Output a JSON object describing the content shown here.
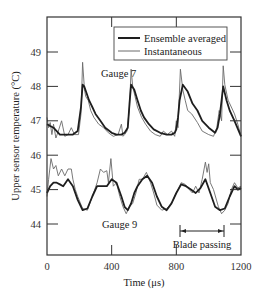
{
  "chart_data": {
    "type": "line",
    "title": "",
    "xlabel": "Time (μs)",
    "ylabel": "Upper sensor temperature (°C)",
    "xlim": [
      0,
      1200
    ],
    "ylim": [
      43.1,
      50.0
    ],
    "xticks": [
      0,
      400,
      800,
      1200
    ],
    "xtick_labels": [
      "0",
      "400",
      "800",
      "1200"
    ],
    "yticks": [
      44,
      45,
      46,
      47,
      48,
      49
    ],
    "ytick_labels": [
      "44",
      "45",
      "46",
      "47",
      "48",
      "49"
    ],
    "grid": false,
    "legend": {
      "position": "upper right",
      "entries": [
        {
          "label": "Ensemble averaged",
          "style": "thick"
        },
        {
          "label": "Instantaneous",
          "style": "thin"
        }
      ]
    },
    "annotations": [
      {
        "text": "Gauge 7",
        "x": 270,
        "y": 48.55
      },
      {
        "text": "Gauge 9",
        "x": 510,
        "y": 43.85
      },
      {
        "text": "Blade passing",
        "x_start": 820,
        "x_end": 1100,
        "y": 44.0,
        "type": "double-arrow"
      }
    ],
    "series": [
      {
        "name": "Gauge 7 - Ensemble averaged",
        "x": [
          0,
          20,
          40,
          60,
          80,
          100,
          130,
          160,
          190,
          210,
          220,
          230,
          245,
          260,
          280,
          300,
          330,
          360,
          400,
          430,
          460,
          480,
          500,
          510,
          520,
          540,
          560,
          580,
          600,
          630,
          660,
          700,
          740,
          770,
          790,
          800,
          810,
          820,
          840,
          870,
          900,
          930,
          960,
          1000,
          1040,
          1055,
          1070,
          1090,
          1110,
          1130,
          1160,
          1200
        ],
        "y": [
          46.9,
          46.85,
          46.8,
          46.7,
          46.6,
          46.6,
          46.6,
          46.6,
          46.7,
          47.4,
          48.05,
          48.0,
          47.8,
          47.6,
          47.4,
          47.2,
          47.0,
          46.8,
          46.65,
          46.6,
          46.6,
          46.65,
          46.8,
          47.5,
          48.05,
          47.9,
          47.6,
          47.3,
          47.1,
          46.9,
          46.75,
          46.65,
          46.6,
          46.6,
          46.65,
          46.75,
          47.1,
          47.6,
          48.05,
          47.85,
          47.5,
          47.3,
          47.0,
          46.8,
          46.65,
          46.8,
          47.2,
          48.0,
          47.6,
          47.3,
          47.0,
          46.55
        ]
      },
      {
        "name": "Gauge 7 - Instantaneous",
        "x": [
          0,
          10,
          20,
          30,
          40,
          55,
          70,
          90,
          110,
          130,
          150,
          170,
          195,
          210,
          220,
          232,
          240,
          255,
          270,
          290,
          320,
          350,
          380,
          410,
          440,
          460,
          470,
          480,
          495,
          510,
          520,
          530,
          545,
          560,
          585,
          610,
          640,
          670,
          700,
          720,
          745,
          770,
          790,
          800,
          810,
          825,
          840,
          855,
          870,
          895,
          930,
          960,
          1000,
          1030,
          1050,
          1065,
          1080,
          1090,
          1100,
          1120,
          1140,
          1160,
          1180,
          1200
        ],
        "y": [
          47.1,
          46.8,
          46.95,
          46.6,
          46.9,
          46.5,
          46.7,
          47.0,
          46.55,
          46.6,
          46.8,
          46.6,
          46.6,
          47.2,
          48.7,
          47.9,
          47.7,
          47.6,
          47.3,
          47.1,
          46.9,
          46.8,
          46.65,
          46.55,
          46.6,
          46.9,
          46.55,
          46.6,
          46.7,
          47.4,
          48.5,
          48.0,
          47.7,
          47.4,
          47.1,
          46.9,
          46.7,
          46.6,
          46.55,
          46.7,
          46.6,
          46.7,
          46.55,
          47.0,
          46.8,
          48.5,
          47.9,
          47.6,
          47.3,
          47.2,
          46.95,
          46.7,
          46.6,
          46.55,
          46.8,
          47.3,
          47.0,
          48.6,
          48.05,
          47.6,
          47.4,
          47.2,
          46.9,
          46.55
        ]
      },
      {
        "name": "Gauge 9 - Ensemble averaged",
        "x": [
          0,
          20,
          40,
          60,
          80,
          100,
          130,
          160,
          190,
          220,
          250,
          280,
          310,
          340,
          370,
          400,
          430,
          460,
          480,
          500,
          520,
          540,
          560,
          590,
          620,
          650,
          680,
          710,
          740,
          770,
          800,
          830,
          860,
          890,
          920,
          950,
          980,
          1010,
          1040,
          1070,
          1100,
          1130,
          1160,
          1180,
          1200
        ],
        "y": [
          44.9,
          45.1,
          45.2,
          45.2,
          45.15,
          45.1,
          45.3,
          45.1,
          44.7,
          44.4,
          44.45,
          44.8,
          45.1,
          45.1,
          45.1,
          45.3,
          45.2,
          44.8,
          44.5,
          44.4,
          44.6,
          44.9,
          45.1,
          45.3,
          45.4,
          45.2,
          44.8,
          44.5,
          44.4,
          44.6,
          44.9,
          45.15,
          45.1,
          45.0,
          44.9,
          45.05,
          45.3,
          44.9,
          44.5,
          44.4,
          44.45,
          44.8,
          45.1,
          45.0,
          45.05
        ]
      },
      {
        "name": "Gauge 9 - Instantaneous",
        "x": [
          0,
          10,
          25,
          40,
          55,
          70,
          90,
          110,
          130,
          150,
          160,
          175,
          190,
          220,
          250,
          280,
          310,
          330,
          350,
          370,
          380,
          395,
          410,
          430,
          450,
          470,
          490,
          510,
          530,
          550,
          570,
          590,
          615,
          640,
          660,
          680,
          710,
          740,
          770,
          800,
          830,
          855,
          880,
          900,
          920,
          940,
          960,
          980,
          990,
          1000,
          1010,
          1030,
          1060,
          1080,
          1100,
          1120,
          1140,
          1160,
          1180,
          1200
        ],
        "y": [
          44.8,
          45.3,
          45.9,
          45.6,
          45.7,
          45.4,
          45.6,
          45.4,
          45.6,
          45.6,
          45.3,
          45.0,
          44.8,
          44.45,
          44.4,
          44.8,
          45.2,
          45.6,
          45.5,
          45.55,
          45.2,
          45.9,
          45.1,
          45.2,
          44.8,
          44.5,
          44.3,
          44.5,
          44.6,
          44.9,
          45.3,
          45.3,
          45.5,
          45.2,
          44.9,
          44.55,
          44.4,
          44.45,
          44.6,
          44.9,
          45.2,
          45.15,
          45.0,
          44.9,
          45.1,
          44.9,
          45.3,
          45.8,
          45.5,
          45.75,
          45.2,
          45.0,
          44.5,
          44.3,
          44.4,
          44.6,
          45.0,
          45.2,
          45.05,
          45.1
        ]
      }
    ]
  },
  "plot": {
    "frame": {
      "left": 47,
      "top": 17,
      "right": 241,
      "bottom": 255
    },
    "px_per_us": 0.16167,
    "px_per_deg": 34.4,
    "y_ref_value": 49,
    "y_ref_px": 52
  },
  "colors": {
    "axis": "#333333",
    "ensemble": "#1e1e1e",
    "instantaneous": "#6a6a6a",
    "background": "#ffffff"
  }
}
